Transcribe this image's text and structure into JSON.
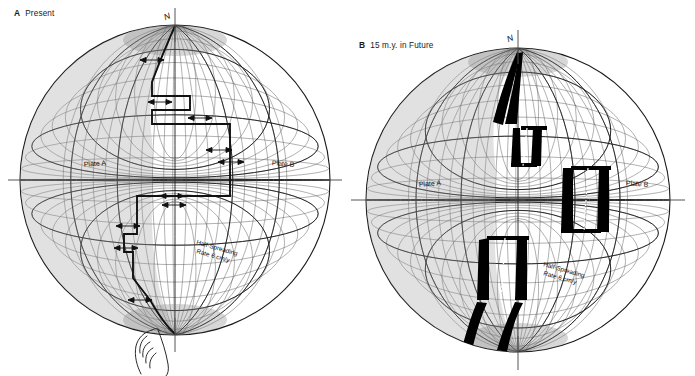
{
  "figure": {
    "background_color": "#ffffff",
    "line_color": "#1a1a1a",
    "new_crust_color": "#000000",
    "graticule_color": "#3a3a3a",
    "shading_color": "#b9b9b9"
  },
  "panels": [
    {
      "id": "A",
      "letter": "A",
      "title": "Present",
      "axis_label": "N",
      "plate_a_label": "Plate A",
      "plate_b_label": "Plate B",
      "rate_label_line1": "Half-Spreading",
      "rate_label_line2": "Rate 6 cm/y",
      "hand_present": true,
      "new_crust_bands": 0
    },
    {
      "id": "B",
      "letter": "B",
      "title": "15 m.y. in Future",
      "axis_label": "N",
      "plate_a_label": "Plate A",
      "plate_b_label": "Plate B",
      "rate_label_line1": "Half-Spreading",
      "rate_label_line2": "Rate 6 cm/y",
      "hand_present": false,
      "new_crust_bands": 6
    }
  ]
}
